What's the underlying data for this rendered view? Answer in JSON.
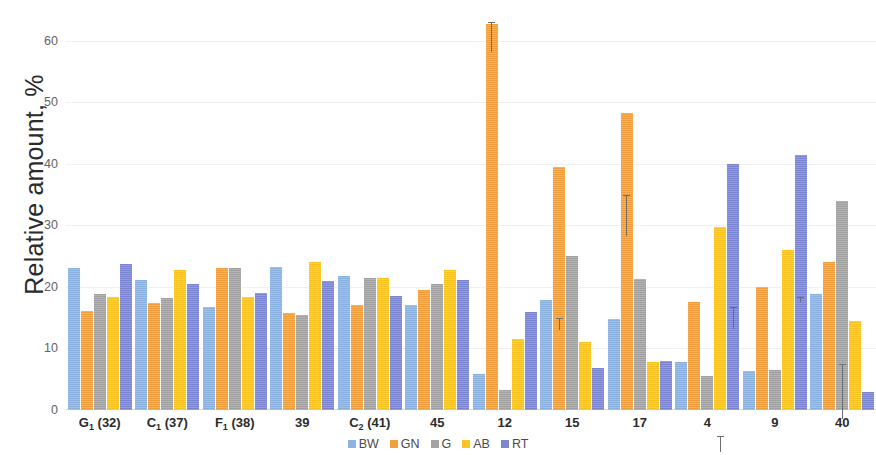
{
  "chart_data": {
    "type": "bar",
    "title": "",
    "xlabel": "",
    "ylabel": "Relative amount, %",
    "ylim": [
      0,
      65
    ],
    "yticks": [
      0,
      10,
      20,
      30,
      40,
      50,
      60
    ],
    "grid": true,
    "legend_position": "bottom",
    "categories": [
      "G₁ (32)",
      "C₁ (37)",
      "F₁ (38)",
      "39",
      "C₂ (41)",
      "45",
      "12",
      "15",
      "17",
      "4",
      "9",
      "40"
    ],
    "category_labels_html": [
      {
        "main": "G",
        "sub": "1",
        "suffix": " (32)"
      },
      {
        "main": "C",
        "sub": "1",
        "suffix": " (37)"
      },
      {
        "main": "F",
        "sub": "1",
        "suffix": " (38)"
      },
      {
        "main": "39",
        "sub": "",
        "suffix": ""
      },
      {
        "main": "C",
        "sub": "2",
        "suffix": " (41)"
      },
      {
        "main": "45",
        "sub": "",
        "suffix": ""
      },
      {
        "main": "12",
        "sub": "",
        "suffix": ""
      },
      {
        "main": "15",
        "sub": "",
        "suffix": ""
      },
      {
        "main": "17",
        "sub": "",
        "suffix": ""
      },
      {
        "main": "4",
        "sub": "",
        "suffix": ""
      },
      {
        "main": "9",
        "sub": "",
        "suffix": ""
      },
      {
        "main": "40",
        "sub": "",
        "suffix": ""
      }
    ],
    "series": [
      {
        "name": "BW",
        "color": "#8cb3e2",
        "values": [
          23.0,
          21.2,
          16.8,
          23.3,
          21.8,
          17.0,
          5.8,
          17.8,
          14.8,
          7.8,
          6.3,
          18.8
        ],
        "errors": [
          1.0,
          2.5,
          2.0,
          1.0,
          0.9,
          1.5,
          0.3,
          1.2,
          1.5,
          0.4,
          0.5,
          2.0
        ]
      },
      {
        "name": "GN",
        "color": "#f4a03c",
        "values": [
          16.1,
          17.4,
          23.0,
          15.8,
          17.0,
          19.5,
          62.8,
          39.5,
          48.3,
          17.5,
          20.0,
          24.1
        ],
        "errors": [
          1.0,
          1.6,
          4.2,
          0.6,
          0.8,
          0.8,
          2.5,
          1.0,
          3.3,
          2.0,
          1.5,
          1.3
        ]
      },
      {
        "name": "G",
        "color": "#a3a3a3",
        "values": [
          18.8,
          18.2,
          23.0,
          15.5,
          21.5,
          20.5,
          3.3,
          25.0,
          21.3,
          5.5,
          6.5,
          34.0
        ],
        "errors": [
          0.8,
          1.5,
          2.2,
          0.7,
          1.6,
          0.7,
          0.3,
          0.5,
          1.3,
          1.0,
          0.3,
          4.5
        ]
      },
      {
        "name": "AB",
        "color": "#fcc521",
        "values": [
          18.3,
          22.8,
          18.4,
          24.0,
          21.5,
          22.8,
          11.5,
          11.0,
          7.8,
          29.7,
          26.0,
          14.5
        ],
        "errors": [
          3.8,
          2.8,
          1.7,
          3.2,
          1.6,
          1.1,
          0.8,
          0.7,
          0.7,
          1.3,
          1.0,
          0.7
        ]
      },
      {
        "name": "RT",
        "color": "#7b86d4",
        "values": [
          23.8,
          20.5,
          19.0,
          21.0,
          18.6,
          21.2,
          16.0,
          6.8,
          8.0,
          40.0,
          41.5,
          3.0
        ],
        "errors": [
          1.5,
          1.5,
          2.2,
          1.3,
          2.6,
          1.2,
          0.7,
          0.4,
          0.5,
          1.8,
          0.4,
          0.3
        ]
      }
    ],
    "legend": [
      {
        "label": "BW",
        "color": "#8cb3e2"
      },
      {
        "label": "GN",
        "color": "#f4a03c"
      },
      {
        "label": "G",
        "color": "#a3a3a3"
      },
      {
        "label": "AB",
        "color": "#fcc521"
      },
      {
        "label": "RT",
        "color": "#7b86d4"
      }
    ]
  }
}
